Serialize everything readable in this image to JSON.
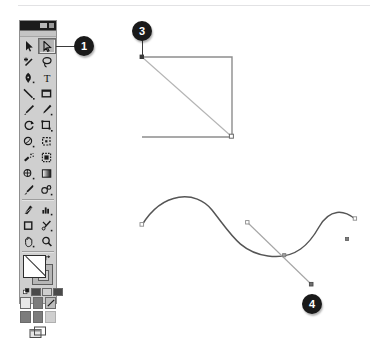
{
  "figure": {
    "background_color": "#ffffff",
    "rule_color": "#e2e2e4"
  },
  "toolbox": {
    "name": "Toolbox palette",
    "title_bar_color": "#1c1c1c",
    "body_color": "#cfcfcf",
    "border_color": "#8f8f8f",
    "window_controls": [
      "collapse",
      "close"
    ],
    "selected_tool": "direct-selection-tool",
    "rows": [
      {
        "tools": [
          {
            "name": "selection-tool",
            "label": "Selection",
            "icon": "arrow-solid",
            "selected": false
          },
          {
            "name": "direct-selection-tool",
            "label": "Direct Selection",
            "icon": "arrow-hollow",
            "selected": true
          }
        ]
      },
      {
        "tools": [
          {
            "name": "magic-wand-tool",
            "label": "Magic Wand",
            "icon": "magic-wand",
            "selected": false
          },
          {
            "name": "lasso-tool",
            "label": "Lasso",
            "icon": "lasso",
            "selected": false
          }
        ]
      },
      {
        "tools": [
          {
            "name": "pen-tool",
            "label": "Pen",
            "icon": "pen-nib",
            "selected": false
          },
          {
            "name": "type-tool",
            "label": "Type",
            "icon": "letter-T",
            "selected": false
          }
        ]
      },
      {
        "tools": [
          {
            "name": "line-segment-tool",
            "label": "Line Segment",
            "icon": "diagonal-line",
            "selected": false
          },
          {
            "name": "rectangle-tool",
            "label": "Rectangle",
            "icon": "rectangle",
            "selected": false
          }
        ]
      },
      {
        "tools": [
          {
            "name": "paintbrush-tool",
            "label": "Paintbrush",
            "icon": "paintbrush",
            "selected": false
          },
          {
            "name": "pencil-tool",
            "label": "Pencil",
            "icon": "pencil",
            "selected": false
          }
        ]
      },
      {
        "tools": [
          {
            "name": "rotate-tool",
            "label": "Rotate",
            "icon": "rotate",
            "selected": false
          },
          {
            "name": "scale-tool",
            "label": "Scale",
            "icon": "scale",
            "selected": false
          }
        ]
      },
      {
        "tools": [
          {
            "name": "warp-tool",
            "label": "Warp",
            "icon": "warp",
            "selected": false
          },
          {
            "name": "free-transform-tool",
            "label": "Free Transform",
            "icon": "free-transform",
            "selected": false
          }
        ]
      },
      {
        "tools": [
          {
            "name": "symbol-sprayer-tool",
            "label": "Symbol Sprayer",
            "icon": "symbol-sprayer",
            "selected": false
          },
          {
            "name": "column-graph-tool",
            "label": "Column Graph",
            "icon": "column-graph",
            "selected": false
          }
        ]
      },
      {
        "tools": [
          {
            "name": "mesh-tool",
            "label": "Mesh",
            "icon": "mesh",
            "selected": false
          },
          {
            "name": "gradient-tool",
            "label": "Gradient",
            "icon": "gradient-bar",
            "selected": false
          }
        ]
      },
      {
        "tools": [
          {
            "name": "eyedropper-tool",
            "label": "Eyedropper",
            "icon": "eyedropper",
            "selected": false
          },
          {
            "name": "blend-tool",
            "label": "Blend",
            "icon": "blend",
            "selected": false
          }
        ]
      },
      {
        "tools": [
          {
            "name": "slice-tool",
            "label": "Slice",
            "icon": "slice",
            "selected": false
          },
          {
            "name": "graph-tool",
            "label": "Graph",
            "icon": "bar-graph",
            "selected": false
          }
        ]
      },
      {
        "tools": [
          {
            "name": "artboard-tool",
            "label": "Artboard",
            "icon": "artboard",
            "selected": false
          },
          {
            "name": "scissors-tool",
            "label": "Scissors",
            "icon": "scissors",
            "selected": false
          }
        ]
      },
      {
        "tools": [
          {
            "name": "hand-tool",
            "label": "Hand",
            "icon": "hand",
            "selected": false
          },
          {
            "name": "zoom-tool",
            "label": "Zoom",
            "icon": "magnifier",
            "selected": false
          }
        ]
      }
    ],
    "color_controls": {
      "fill_swatch": {
        "name": "fill-swatch",
        "color": "#ffffff"
      },
      "stroke_swatch": {
        "name": "stroke-swatch",
        "color": "#b6b6b6"
      },
      "swap_icon": "swap-fill-stroke-icon",
      "default_icon": "default-fill-stroke-icon",
      "modes": [
        "color",
        "gradient",
        "none"
      ]
    },
    "drawing_modes": [
      "draw-normal",
      "draw-behind",
      "draw-inside"
    ],
    "screen_mode": {
      "name": "screen-mode-button",
      "icon": "screen-mode-icon"
    }
  },
  "callouts": [
    {
      "id": "1",
      "label": "1",
      "name": "callout-1",
      "target": "direct-selection-tool"
    },
    {
      "id": "3",
      "label": "3",
      "name": "callout-3",
      "target": "rectangle-top-left-anchor"
    },
    {
      "id": "4",
      "label": "4",
      "name": "callout-4",
      "target": "curve-direction-handle"
    }
  ],
  "artwork": {
    "rectangle": {
      "name": "rectangle-path",
      "stroke_color": "#8a8a8a",
      "points": {
        "top_left": [
          142,
          57
        ],
        "top_right": [
          232,
          57
        ],
        "bottom_right": [
          232,
          137
        ],
        "bottom_left": [
          142,
          137
        ]
      },
      "diagonal": {
        "name": "diagonal-selection-line",
        "from": [
          142,
          57
        ],
        "to": [
          232,
          137
        ],
        "stroke_color": "#b0b0b0"
      },
      "anchors": [
        {
          "name": "rectangle-top-left-anchor",
          "x": 142,
          "y": 57,
          "filled": true
        },
        {
          "name": "rectangle-bottom-right-anchor",
          "x": 232,
          "y": 137,
          "filled": false
        }
      ]
    },
    "curve": {
      "name": "bezier-curve-path",
      "stroke_color": "#4a4a4a",
      "path": "M 142,224 C 160,196 192,192 207,208 C 228,230 240,258 270,258 C 298,258 308,244 316,228",
      "anchors": [
        {
          "name": "curve-start-anchor",
          "x": 142,
          "y": 224
        },
        {
          "name": "curve-middle-anchor",
          "x": 248,
          "y": 224
        },
        {
          "name": "curve-lower-anchor",
          "x": 284,
          "y": 255
        },
        {
          "name": "curve-end-anchor",
          "x": 354,
          "y": 219
        },
        {
          "name": "curve-handle-anchor",
          "x": 347,
          "y": 239
        }
      ],
      "direction_handle": {
        "name": "curve-direction-handle",
        "from": [
          247,
          223
        ],
        "to": [
          311,
          283
        ],
        "stroke_color": "#9a9a9a"
      }
    }
  }
}
